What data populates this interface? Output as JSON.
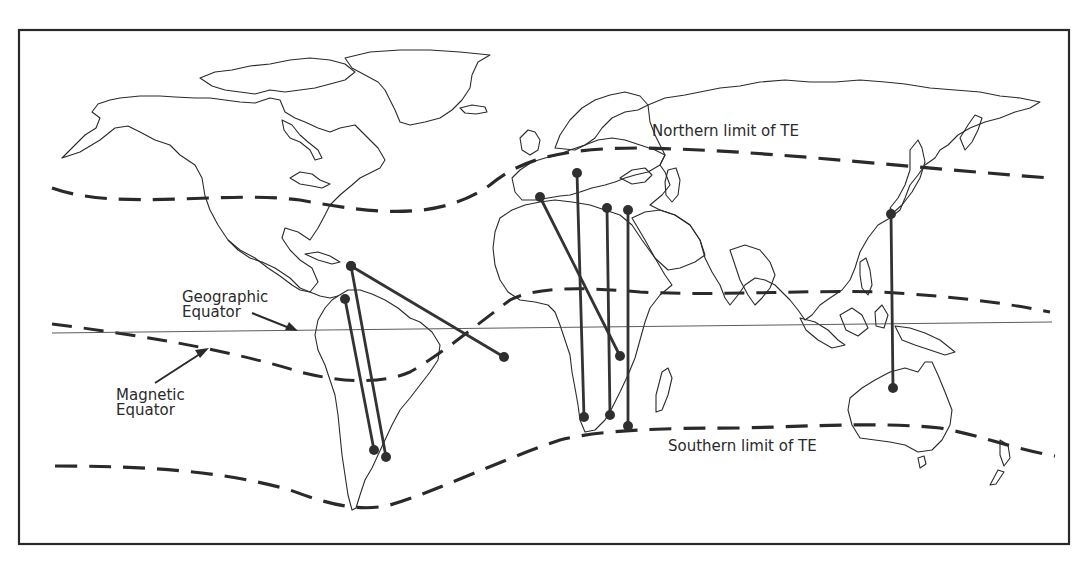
{
  "labels": {
    "northern_limit": "Northern limit of TE",
    "southern_limit": "Southern limit of TE",
    "geographic_equator_line1": "Geographic",
    "geographic_equator_line2": "Equator",
    "magnetic_equator_line1": "Magnetic",
    "magnetic_equator_line2": "Equator"
  },
  "paths": [
    {
      "name": "caribbean-to-south-atlantic",
      "from": "Puerto Rico",
      "to": "South Atlantic"
    },
    {
      "name": "caribbean-to-argentina",
      "from": "Puerto Rico",
      "to": "Argentina"
    },
    {
      "name": "colombia-to-argentina",
      "from": "Colombia",
      "to": "Argentina"
    },
    {
      "name": "spain-to-east-africa",
      "from": "Spain",
      "to": "East Africa"
    },
    {
      "name": "italy-to-south-africa",
      "from": "Italy",
      "to": "South Africa"
    },
    {
      "name": "greece-to-south-africa",
      "from": "Eastern Mediterranean",
      "to": "South Africa"
    },
    {
      "name": "cyprus-to-south-africa",
      "from": "Cyprus",
      "to": "South Africa"
    },
    {
      "name": "japan-to-australia",
      "from": "Japan",
      "to": "Australia"
    }
  ],
  "colors": {
    "ink": "#2a2a2a",
    "background": "#ffffff"
  }
}
